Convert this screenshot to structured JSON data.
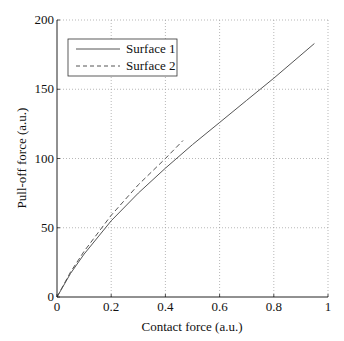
{
  "chart_data": {
    "type": "line",
    "title": "",
    "xlabel": "Contact force (a.u.)",
    "ylabel": "Pull-off force (a.u.)",
    "xlim": [
      0,
      1
    ],
    "ylim": [
      0,
      200
    ],
    "xticks": [
      0,
      0.2,
      0.4,
      0.6,
      0.8,
      1
    ],
    "xtick_labels": [
      "0",
      "0.2",
      "0.4",
      "0.6",
      "0.8",
      "1"
    ],
    "yticks": [
      0,
      50,
      100,
      150,
      200
    ],
    "ytick_labels": [
      "0",
      "50",
      "100",
      "150",
      "200"
    ],
    "grid": true,
    "legend_position": "upper left",
    "series": [
      {
        "name": "Surface 1",
        "style": "solid",
        "x": [
          0,
          0.05,
          0.1,
          0.2,
          0.3,
          0.4,
          0.5,
          0.6,
          0.7,
          0.8,
          0.95
        ],
        "y": [
          0,
          17,
          31,
          55,
          75,
          93,
          110,
          126,
          142,
          158,
          183
        ]
      },
      {
        "name": "Surface 2",
        "style": "dashed",
        "x": [
          0,
          0.05,
          0.1,
          0.2,
          0.3,
          0.4,
          0.465
        ],
        "y": [
          0,
          18,
          33,
          59,
          81,
          100,
          113
        ]
      }
    ]
  },
  "colors": {
    "line": "#555555",
    "axis": "#222222",
    "grid": "#9a9a9a"
  }
}
